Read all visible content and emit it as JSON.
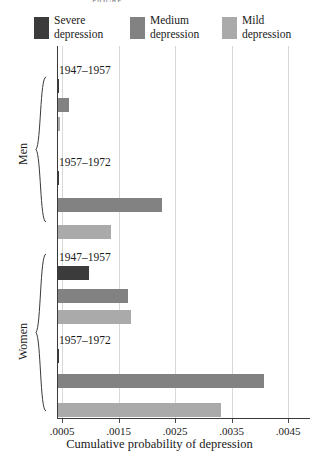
{
  "figure": {
    "top_caption_remnant": "FIGURE",
    "x_axis_title": "Cumulative probability of depression",
    "x_tick_labels": [
      ".0005",
      ".0015",
      ".0025",
      ".0035",
      ".0045"
    ],
    "group_labels": [
      "Men",
      "Women"
    ],
    "period_labels": [
      "1947–1957",
      "1957–1972"
    ]
  },
  "legend": {
    "items": [
      {
        "label_line1": "Severe",
        "label_line2": "depression",
        "color": "#3b3b3b"
      },
      {
        "label_line1": "Medium",
        "label_line2": "depression",
        "color": "#828282"
      },
      {
        "label_line1": "Mild",
        "label_line2": "depression",
        "color": "#aaaaaa"
      }
    ]
  },
  "colors": {
    "severe": "#3b3b3b",
    "medium": "#828282",
    "mild": "#aaaaaa",
    "axis": "#3a3a3a",
    "grid": "#d8d8d8",
    "text": "#1a1a1a"
  },
  "chart_data": {
    "type": "bar",
    "orientation": "horizontal",
    "title": "",
    "xlabel": "Cumulative probability of depression",
    "ylabel": "",
    "xlim": [
      0.0,
      0.005
    ],
    "xticks": [
      0.0005,
      0.0015,
      0.0025,
      0.0035,
      0.0045
    ],
    "xticklabels": [
      ".0005",
      ".0015",
      ".0025",
      ".0035",
      ".0045"
    ],
    "grid": true,
    "legend_position": "above-plot",
    "series": [
      {
        "name": "Severe depression",
        "color": "#3b3b3b"
      },
      {
        "name": "Medium depression",
        "color": "#828282"
      },
      {
        "name": "Mild depression",
        "color": "#aaaaaa"
      }
    ],
    "groups": [
      {
        "sex": "Men",
        "cohorts": [
          {
            "period": "1947–1957",
            "values": {
              "Severe depression": 0.00035,
              "Medium depression": 0.0006,
              "Mild depression": 0.00045
            }
          },
          {
            "period": "1957–1972",
            "values": {
              "Severe depression": 0.0002,
              "Medium depression": 0.00225,
              "Mild depression": 0.00135
            }
          }
        ]
      },
      {
        "sex": "Women",
        "cohorts": [
          {
            "period": "1947–1957",
            "values": {
              "Severe depression": 0.00095,
              "Medium depression": 0.00165,
              "Mild depression": 0.0017
            }
          },
          {
            "period": "1957–1972",
            "values": {
              "Severe depression": 0.0003,
              "Medium depression": 0.00405,
              "Mild depression": 0.0033
            }
          }
        ]
      }
    ]
  },
  "layout": {
    "plot_left_px": 57,
    "plot_top_px": 46,
    "plot_width_px": 253,
    "plot_height_px": 373,
    "px_per_unit": 56500,
    "x_origin_value": 0.0004096,
    "rows": [
      {
        "kind": "label",
        "y": 18,
        "group": 0,
        "cohort": 0
      },
      {
        "kind": "bar",
        "y": 33,
        "group": 0,
        "cohort": 0,
        "series": 0
      },
      {
        "kind": "bar",
        "y": 52,
        "group": 0,
        "cohort": 0,
        "series": 1
      },
      {
        "kind": "bar",
        "y": 71,
        "group": 0,
        "cohort": 0,
        "series": 2
      },
      {
        "kind": "label",
        "y": 110,
        "group": 0,
        "cohort": 1
      },
      {
        "kind": "bar",
        "y": 125,
        "group": 0,
        "cohort": 1,
        "series": 0
      },
      {
        "kind": "bar",
        "y": 152,
        "group": 0,
        "cohort": 1,
        "series": 1
      },
      {
        "kind": "bar",
        "y": 179,
        "group": 0,
        "cohort": 1,
        "series": 2
      },
      {
        "kind": "label",
        "y": 205,
        "group": 1,
        "cohort": 0
      },
      {
        "kind": "bar",
        "y": 220,
        "group": 1,
        "cohort": 0,
        "series": 0
      },
      {
        "kind": "bar",
        "y": 243,
        "group": 1,
        "cohort": 0,
        "series": 1
      },
      {
        "kind": "bar",
        "y": 264,
        "group": 1,
        "cohort": 0,
        "series": 2
      },
      {
        "kind": "label",
        "y": 288,
        "group": 1,
        "cohort": 1
      },
      {
        "kind": "bar",
        "y": 303,
        "group": 1,
        "cohort": 1,
        "series": 0
      },
      {
        "kind": "bar",
        "y": 328,
        "group": 1,
        "cohort": 1,
        "series": 1
      },
      {
        "kind": "bar",
        "y": 357,
        "group": 1,
        "cohort": 1,
        "series": 2
      }
    ],
    "brackets": [
      {
        "group": 0,
        "top": 76,
        "height": 147,
        "label_x": 16,
        "label_y": 165
      },
      {
        "group": 1,
        "top": 253,
        "height": 159,
        "label_x": 16,
        "label_y": 360
      }
    ]
  }
}
